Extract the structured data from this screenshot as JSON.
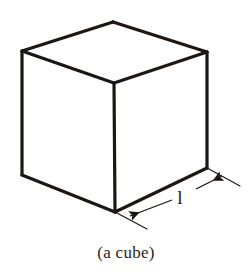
{
  "figure": {
    "type": "geometric-solid-diagram",
    "shape": "cube",
    "caption": "(a cube)",
    "dimension_label": "l",
    "background_color": "#ffffff",
    "line_color": "#1d1713",
    "text_color": "#2b2420",
    "line_width_px": 3,
    "canvas": {
      "width": 252,
      "height": 275
    },
    "vertices": {
      "top": [
        113,
        22
      ],
      "left_top": [
        22,
        51
      ],
      "right_top": [
        207,
        52
      ],
      "center_top": [
        114,
        83
      ],
      "left_bottom": [
        22,
        175
      ],
      "bottom": [
        115,
        212
      ],
      "right_bottom": [
        207,
        168
      ]
    },
    "edges": [
      {
        "name": "top-back-left",
        "from": "left_top",
        "to": "top"
      },
      {
        "name": "top-back-right",
        "from": "top",
        "to": "right_top"
      },
      {
        "name": "top-front-left",
        "from": "left_top",
        "to": "center_top"
      },
      {
        "name": "top-front-right",
        "from": "center_top",
        "to": "right_top"
      },
      {
        "name": "vertical-left",
        "from": "left_top",
        "to": "left_bottom"
      },
      {
        "name": "vertical-center",
        "from": "center_top",
        "to": "bottom"
      },
      {
        "name": "vertical-right",
        "from": "right_top",
        "to": "right_bottom"
      },
      {
        "name": "bottom-left",
        "from": "left_bottom",
        "to": "bottom"
      },
      {
        "name": "bottom-right",
        "from": "bottom",
        "to": "right_bottom"
      }
    ],
    "dimension": {
      "measures_edge": "bottom-right",
      "extension_line_start": [
        [
          115,
          212
        ],
        [
          147,
          229
        ]
      ],
      "extension_line_end": [
        [
          207,
          168
        ],
        [
          240,
          186
        ]
      ],
      "arrow_left": {
        "tail": [
          172,
          200
        ],
        "head": [
          128,
          217
        ],
        "direction": "down-left"
      },
      "arrow_right": {
        "tail": [
          196,
          189
        ],
        "head": [
          224,
          175
        ],
        "direction": "up-right"
      }
    }
  }
}
